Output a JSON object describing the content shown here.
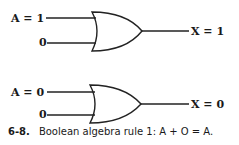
{
  "gates": [
    {
      "type": "OR",
      "input_a_label": "A = 1",
      "input_b_label": "0",
      "output_label": "X = 1"
    },
    {
      "type": "OR",
      "input_a_label": "A = 0",
      "input_b_label": "0",
      "output_label": "X = 0"
    }
  ],
  "caption": {
    "number": "6-8.",
    "text": "Boolean algebra rule 1: A + O = A."
  }
}
